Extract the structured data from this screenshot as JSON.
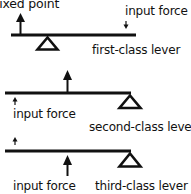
{
  "colors": {
    "ink": "#111111",
    "background": "#ffffff"
  },
  "levers": [
    {
      "name": "first-class lever",
      "label": "first-class lever",
      "fixed_point_label": "fixed point",
      "input_force_label": "input force"
    },
    {
      "name": "second-class lever",
      "label": "second-class lever",
      "input_force_label": "input force"
    },
    {
      "name": "third-class lever",
      "label": "third-class lever",
      "input_force_label": "input force"
    }
  ]
}
